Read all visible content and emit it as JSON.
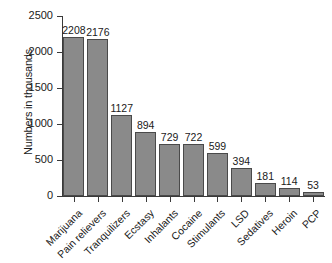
{
  "chart_data": {
    "type": "bar",
    "title": "",
    "xlabel": "",
    "ylabel": "Numbers in thousands",
    "ylim": [
      0,
      2500
    ],
    "yticks": [
      0,
      500,
      1000,
      1500,
      2000,
      2500
    ],
    "ytick_labels": [
      "0",
      "500",
      "1000",
      "1500",
      "2000",
      "2500"
    ],
    "grid": false,
    "legend": "none",
    "orientation": "vertical",
    "bar_color": "#8a8a8a",
    "bar_edge_color": "#4a4a4a",
    "background_color": "#ffffff",
    "value_labels_shown": true,
    "category_label_rotation_deg": -45,
    "categories": [
      "Marijuana",
      "Pain relievers",
      "Tranquilizers",
      "Ecstasy",
      "Inhalants",
      "Cocaine",
      "Stimulants",
      "LSD",
      "Sedatives",
      "Heroin",
      "PCP"
    ],
    "values": [
      2208,
      2176,
      1127,
      894,
      729,
      722,
      599,
      394,
      181,
      114,
      53
    ],
    "value_label_text": [
      "2208",
      "2176",
      "1127",
      "894",
      "729",
      "722",
      "599",
      "394",
      "181",
      "114",
      "53"
    ]
  }
}
